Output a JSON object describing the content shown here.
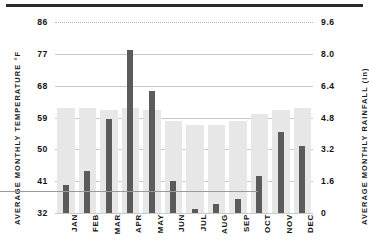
{
  "chart_data": {
    "type": "bar",
    "title": "",
    "categories": [
      "JAN",
      "FEB",
      "MAR",
      "APR",
      "MAY",
      "JUN",
      "JUL",
      "AUG",
      "SEP",
      "OCT",
      "NOV",
      "DEC"
    ],
    "series": [
      {
        "name": "Average Monthly Temperature",
        "unit": "°F",
        "axis": "left",
        "color": "#5b5b5b",
        "values": [
          40,
          44,
          58.5,
          78,
          66.5,
          41,
          33,
          34.5,
          36,
          42.5,
          55,
          51
        ]
      },
      {
        "name": "Average Monthly Rainfall",
        "unit": "in",
        "axis": "right",
        "color": "#e7e7e7",
        "values": [
          5.3,
          5.3,
          5.2,
          5.3,
          5.2,
          4.6,
          4.4,
          4.4,
          4.6,
          5.0,
          5.2,
          5.3
        ]
      }
    ],
    "left_axis": {
      "label": "AVERAGE MONTHLY TEMPERATURE °F",
      "ticks": [
        "86",
        "77",
        "68",
        "59",
        "50",
        "41",
        "32"
      ],
      "ylim": [
        32,
        86
      ]
    },
    "right_axis": {
      "label": "AVERAGE MONTHLY RAINFALL (in)",
      "ticks": [
        "9.6",
        "8.0",
        "6.4",
        "4.8",
        "3.2",
        "1.6",
        "0"
      ],
      "ylim": [
        0,
        9.6
      ]
    },
    "xlabel": "",
    "grid": true,
    "legend": "none"
  }
}
